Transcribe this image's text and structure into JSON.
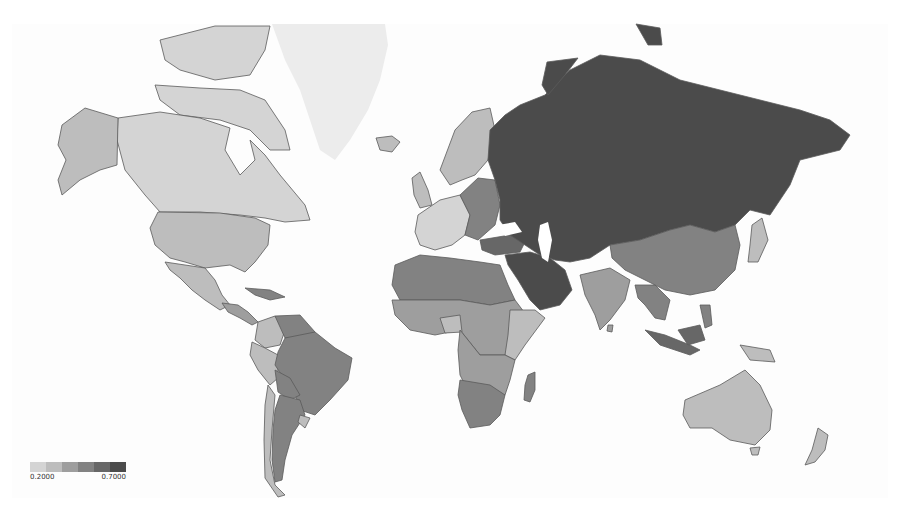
{
  "map": {
    "type": "choropleth",
    "projection": "mercator",
    "palette": [
      "#d4d4d4",
      "#bdbdbd",
      "#9e9e9e",
      "#828282",
      "#676767",
      "#4b4b4b"
    ],
    "no_data_color": "#ececec",
    "regions": [
      {
        "name": "Greenland",
        "level": "nodata"
      },
      {
        "name": "Canada",
        "level": 0
      },
      {
        "name": "Alaska (USA)",
        "level": 1
      },
      {
        "name": "United States",
        "level": 1
      },
      {
        "name": "Mexico",
        "level": 1
      },
      {
        "name": "Central America",
        "level": 2
      },
      {
        "name": "Colombia",
        "level": 1
      },
      {
        "name": "Venezuela",
        "level": 3
      },
      {
        "name": "Peru",
        "level": 1
      },
      {
        "name": "Brazil",
        "level": 3
      },
      {
        "name": "Bolivia",
        "level": 3
      },
      {
        "name": "Argentina",
        "level": 3
      },
      {
        "name": "Chile",
        "level": 1
      },
      {
        "name": "Western Europe",
        "level": 0
      },
      {
        "name": "Scandinavia",
        "level": 1
      },
      {
        "name": "Eastern Europe",
        "level": 3
      },
      {
        "name": "Russia",
        "level": 5
      },
      {
        "name": "Central Asia",
        "level": 5
      },
      {
        "name": "Middle East",
        "level": 5
      },
      {
        "name": "North Africa",
        "level": 3
      },
      {
        "name": "Sub-Saharan Africa",
        "level": 2
      },
      {
        "name": "Southern Africa",
        "level": 3
      },
      {
        "name": "Madagascar",
        "level": 3
      },
      {
        "name": "India",
        "level": 2
      },
      {
        "name": "China",
        "level": 3
      },
      {
        "name": "Japan",
        "level": 1
      },
      {
        "name": "Southeast Asia",
        "level": 3
      },
      {
        "name": "Indonesia",
        "level": 3
      },
      {
        "name": "Australia",
        "level": 1
      },
      {
        "name": "New Zealand",
        "level": 1
      }
    ]
  },
  "legend": {
    "min_label": "0.2000",
    "max_label": "0.7000",
    "min": 0.2,
    "max": 0.7,
    "steps": 6
  }
}
